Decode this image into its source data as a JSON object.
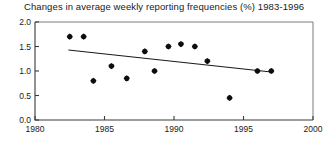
{
  "chart_data": {
    "type": "scatter",
    "title": "Changes in average weekly reporting frequencies (%) 1983-1996",
    "xlabel": "",
    "ylabel": "",
    "xlim": [
      1980,
      2000
    ],
    "ylim": [
      0.0,
      2.0
    ],
    "grid": false,
    "legend": null,
    "xticks": [
      "1980",
      "1985",
      "1990",
      "1995",
      "2000"
    ],
    "xtick_values": [
      1980,
      1985,
      1990,
      1995,
      2000
    ],
    "yticks": [
      "0.0",
      "0.5",
      "1.0",
      "1.5",
      "2.0"
    ],
    "ytick_values": [
      0.0,
      0.5,
      1.0,
      1.5,
      2.0
    ],
    "series": [
      {
        "name": "Average weekly reporting frequency change (%)",
        "marker": "filled-diamond",
        "color": "#0d0d0d",
        "points": [
          {
            "x": 1982.5,
            "y": 1.7
          },
          {
            "x": 1983.5,
            "y": 1.7
          },
          {
            "x": 1984.2,
            "y": 0.8
          },
          {
            "x": 1985.5,
            "y": 1.1
          },
          {
            "x": 1986.6,
            "y": 0.85
          },
          {
            "x": 1987.9,
            "y": 1.4
          },
          {
            "x": 1988.6,
            "y": 1.0
          },
          {
            "x": 1989.6,
            "y": 1.5
          },
          {
            "x": 1990.5,
            "y": 1.55
          },
          {
            "x": 1991.5,
            "y": 1.5
          },
          {
            "x": 1992.4,
            "y": 1.2
          },
          {
            "x": 1994.0,
            "y": 0.45
          },
          {
            "x": 1996.0,
            "y": 1.0
          },
          {
            "x": 1997.0,
            "y": 1.0
          }
        ]
      }
    ],
    "trend_line": {
      "name": "linear-trend",
      "color": "#1a1a1a",
      "start": {
        "x": 1982.4,
        "y": 1.43
      },
      "end": {
        "x": 1997.0,
        "y": 0.98
      }
    }
  }
}
